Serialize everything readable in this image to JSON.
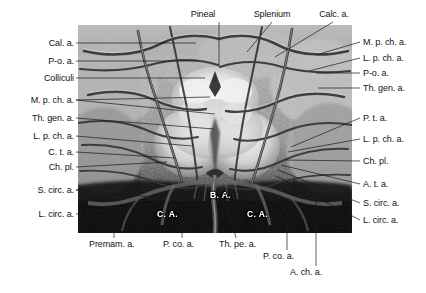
{
  "figure": {
    "kind": "anatomical-photograph",
    "photo_tone": "grayscale"
  },
  "labels_top": [
    {
      "id": "pineal",
      "text": "Pineal",
      "x": 203,
      "y": 11,
      "align": "center",
      "line": [
        {
          "x1": 219,
          "y1": 22,
          "x2": 219,
          "y2": 67
        }
      ]
    },
    {
      "id": "splenium",
      "text": "Splenium",
      "x": 252,
      "y": 11,
      "align": "center",
      "line": [
        {
          "x1": 272,
          "y1": 22,
          "x2": 247,
          "y2": 52
        }
      ]
    },
    {
      "id": "calc-a",
      "text": "Calc. a.",
      "x": 317,
      "y": 11,
      "align": "center",
      "line": [
        {
          "x1": 333,
          "y1": 22,
          "x2": 275,
          "y2": 57
        }
      ]
    }
  ],
  "labels_left": [
    {
      "id": "cal-a",
      "text": "Cal. a.",
      "x": 72,
      "y": 39,
      "line": [
        {
          "x1": 76,
          "y1": 43,
          "x2": 196,
          "y2": 43
        }
      ]
    },
    {
      "id": "p-o-a",
      "text": "P-o. a.",
      "x": 72,
      "y": 57,
      "line": [
        {
          "x1": 76,
          "y1": 61,
          "x2": 198,
          "y2": 61
        }
      ]
    },
    {
      "id": "colliculi",
      "text": "Colliculi",
      "x": 72,
      "y": 74,
      "line": [
        {
          "x1": 76,
          "y1": 78,
          "x2": 205,
          "y2": 78
        }
      ]
    },
    {
      "id": "m-p-ch-a-l",
      "text": "M. p. ch. a.",
      "x": 72,
      "y": 96,
      "line": [
        {
          "x1": 76,
          "y1": 100,
          "x2": 215,
          "y2": 114
        }
      ]
    },
    {
      "id": "th-gen-a-l",
      "text": "Th. gen. a.",
      "x": 72,
      "y": 114,
      "line": [
        {
          "x1": 76,
          "y1": 118,
          "x2": 214,
          "y2": 129
        }
      ]
    },
    {
      "id": "l-p-ch-a-l",
      "text": "L. p. ch. a.",
      "x": 72,
      "y": 132,
      "line": [
        {
          "x1": 76,
          "y1": 136,
          "x2": 192,
          "y2": 146
        }
      ]
    },
    {
      "id": "c-t-a",
      "text": "C. t. a.",
      "x": 72,
      "y": 148,
      "line": [
        {
          "x1": 76,
          "y1": 152,
          "x2": 175,
          "y2": 158
        }
      ]
    },
    {
      "id": "ch-pl-l",
      "text": "Ch. pl.",
      "x": 72,
      "y": 163,
      "line": [
        {
          "x1": 76,
          "y1": 167,
          "x2": 167,
          "y2": 162
        }
      ]
    },
    {
      "id": "s-circ-a-l",
      "text": "S. circ. a.",
      "x": 72,
      "y": 186,
      "line": [
        {
          "x1": 76,
          "y1": 190,
          "x2": 152,
          "y2": 197
        }
      ]
    },
    {
      "id": "l-circ-a-l",
      "text": "L. circ. a.",
      "x": 72,
      "y": 210,
      "line": [
        {
          "x1": 76,
          "y1": 214,
          "x2": 160,
          "y2": 203
        }
      ]
    }
  ],
  "labels_right": [
    {
      "id": "m-p-ch-a-r",
      "text": "M. p. ch. a.",
      "x": 362,
      "y": 38,
      "line": [
        {
          "x1": 360,
          "y1": 42,
          "x2": 316,
          "y2": 55
        }
      ]
    },
    {
      "id": "l-p-ch-a-r",
      "text": "L. p. ch. a.",
      "x": 362,
      "y": 54,
      "line": [
        {
          "x1": 360,
          "y1": 58,
          "x2": 309,
          "y2": 71
        }
      ]
    },
    {
      "id": "p-o-a-r",
      "text": "P-o. a.",
      "x": 362,
      "y": 69,
      "line": [
        {
          "x1": 360,
          "y1": 73,
          "x2": 316,
          "y2": 73
        }
      ]
    },
    {
      "id": "th-gen-a-r",
      "text": "Th. gen. a.",
      "x": 362,
      "y": 84,
      "line": [
        {
          "x1": 360,
          "y1": 88,
          "x2": 318,
          "y2": 88
        }
      ]
    },
    {
      "id": "p-t-a",
      "text": "P. t. a.",
      "x": 362,
      "y": 114,
      "line": [
        {
          "x1": 360,
          "y1": 118,
          "x2": 291,
          "y2": 147
        }
      ]
    },
    {
      "id": "l-p-ch-a-r2",
      "text": "L. p. ch. a.",
      "x": 362,
      "y": 135,
      "line": [
        {
          "x1": 360,
          "y1": 139,
          "x2": 288,
          "y2": 152
        }
      ]
    },
    {
      "id": "ch-pl-r",
      "text": "Ch. pl.",
      "x": 362,
      "y": 157,
      "line": [
        {
          "x1": 360,
          "y1": 161,
          "x2": 285,
          "y2": 160
        }
      ]
    },
    {
      "id": "a-t-a",
      "text": "A. t. a.",
      "x": 362,
      "y": 180,
      "line": [
        {
          "x1": 360,
          "y1": 184,
          "x2": 281,
          "y2": 165
        }
      ]
    },
    {
      "id": "s-circ-a-r",
      "text": "S. circ. a.",
      "x": 362,
      "y": 199,
      "line": [
        {
          "x1": 360,
          "y1": 203,
          "x2": 278,
          "y2": 170
        }
      ]
    },
    {
      "id": "l-circ-a-r",
      "text": "L. circ. a.",
      "x": 362,
      "y": 216,
      "line": [
        {
          "x1": 360,
          "y1": 220,
          "x2": 276,
          "y2": 176
        }
      ]
    }
  ],
  "labels_bottom": [
    {
      "id": "premam-a",
      "text": "Premam. a.",
      "x": 90,
      "y": 240,
      "line": [
        {
          "x1": 114,
          "y1": 238,
          "x2": 114,
          "y2": 210
        }
      ]
    },
    {
      "id": "p-co-a-1",
      "text": "P. co. a.",
      "x": 164,
      "y": 240,
      "line": [
        {
          "x1": 182,
          "y1": 238,
          "x2": 182,
          "y2": 213
        }
      ]
    },
    {
      "id": "th-pe-a",
      "text": "Th. pe. a.",
      "x": 220,
      "y": 240,
      "line": [
        {
          "x1": 236,
          "y1": 238,
          "x2": 225,
          "y2": 193
        }
      ]
    },
    {
      "id": "p-co-a-2",
      "text": "P. co. a.",
      "x": 264,
      "y": 252,
      "line": [
        {
          "x1": 287,
          "y1": 250,
          "x2": 287,
          "y2": 209
        }
      ]
    },
    {
      "id": "a-ch-a",
      "text": "A. ch. a.",
      "x": 291,
      "y": 268,
      "line": [
        {
          "x1": 316,
          "y1": 266,
          "x2": 316,
          "y2": 201
        }
      ]
    }
  ],
  "labels_in_photo": [
    {
      "id": "ba",
      "text": "B. A.",
      "x": 210,
      "y": 194
    },
    {
      "id": "ca-left",
      "text": "C. A.",
      "x": 157,
      "y": 213
    },
    {
      "id": "ca-right",
      "text": "C. A.",
      "x": 247,
      "y": 213
    }
  ],
  "colors": {
    "leader": "#1a1a1a",
    "label_text": "#111111",
    "in_photo_text": "#ffffff",
    "page_bg": "#ffffff"
  }
}
